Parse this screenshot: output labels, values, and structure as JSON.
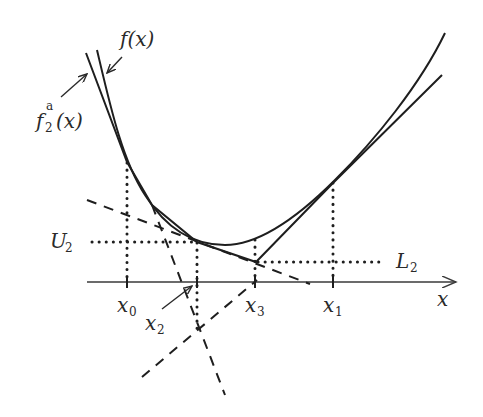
{
  "figure": {
    "labels": {
      "f": "f(x)",
      "f2a_base": "f",
      "f2a_sup": "a",
      "f2a_sub": "2",
      "f2a_arg": "(x)",
      "U2_base": "U",
      "U2_sub": "2",
      "L2_base": "L",
      "L2_sub": "2",
      "x_axis": "x",
      "x0_base": "x",
      "x0_sub": "0",
      "x1_base": "x",
      "x1_sub": "1",
      "x2_base": "x",
      "x2_sub": "2",
      "x3_base": "x",
      "x3_sub": "3"
    },
    "colors": {
      "line": "#1e1e1e",
      "text": "#2a2a2a",
      "background": "#ffffff"
    }
  }
}
